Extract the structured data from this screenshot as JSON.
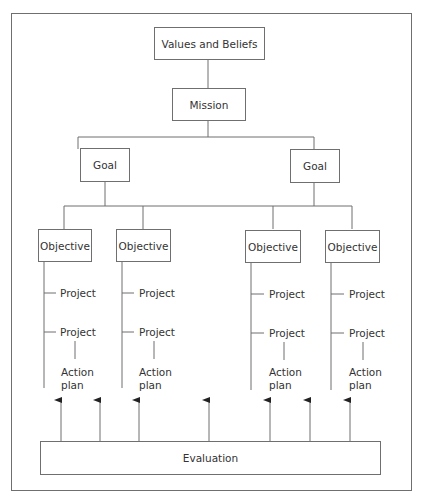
{
  "diagram": {
    "type": "hierarchy",
    "root": {
      "label": "Values and Beliefs",
      "child": {
        "label": "Mission",
        "goals": [
          {
            "label": "Goal",
            "objectives": [
              {
                "label": "Objective",
                "projects": [
                  "Project",
                  "Project"
                ],
                "action_plan": "Action\nplan"
              },
              {
                "label": "Objective",
                "projects": [
                  "Project",
                  "Project"
                ],
                "action_plan": "Action\nplan"
              }
            ]
          },
          {
            "label": "Goal",
            "objectives": [
              {
                "label": "Objective",
                "projects": [
                  "Project",
                  "Project"
                ],
                "action_plan": "Action\nplan"
              },
              {
                "label": "Objective",
                "projects": [
                  "Project",
                  "Project"
                ],
                "action_plan": "Action\nplan"
              }
            ]
          }
        ]
      }
    },
    "evaluation": {
      "label": "Evaluation",
      "arrow_count": 7
    },
    "colors": {
      "line": "#6f6f6f",
      "text": "#333333",
      "background": "#ffffff"
    }
  },
  "labels": {
    "values_beliefs": "Values and Beliefs",
    "mission": "Mission",
    "goal_1": "Goal",
    "goal_2": "Goal",
    "objective_1": "Objective",
    "objective_2": "Objective",
    "objective_3": "Objective",
    "objective_4": "Objective",
    "project": "Project",
    "action": "Action",
    "plan": "plan",
    "evaluation": "Evaluation"
  }
}
